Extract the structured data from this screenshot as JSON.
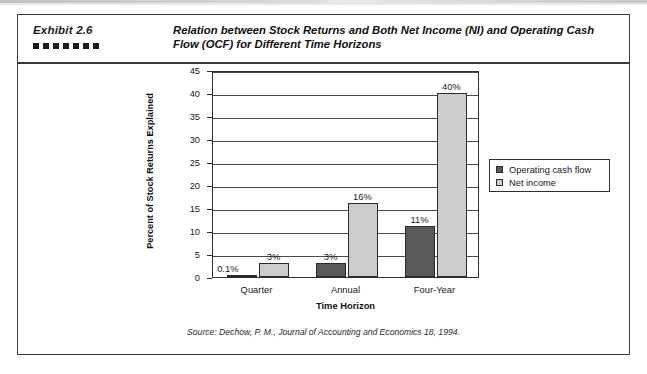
{
  "exhibit": {
    "label": "Exhibit 2.6",
    "dot_count": 7,
    "dot_color": "#1a1a1a"
  },
  "title": "Relation between Stock Returns and Both Net Income (NI) and Operating Cash Flow (OCF) for Different Time Horizons",
  "source": "Source: Dechow, P. M., Journal of Accounting and Economics 18, 1994.",
  "legend": {
    "position": "right",
    "items": [
      {
        "label": "Operating cash flow",
        "color": "#595959"
      },
      {
        "label": "Net income",
        "color": "#cccccc"
      }
    ]
  },
  "chart_data": {
    "type": "bar",
    "title": "Relation between Stock Returns and Both Net Income (NI) and Operating Cash Flow (OCF) for Different Time Horizons",
    "xlabel": "Time Horizon",
    "ylabel": "Percent of Stock Returns Explained",
    "categories": [
      "Quarter",
      "Annual",
      "Four-Year"
    ],
    "series": [
      {
        "name": "Operating cash flow",
        "color": "#595959",
        "values": [
          0.1,
          3,
          11
        ],
        "data_labels": [
          "0.1%",
          "3%",
          "11%"
        ]
      },
      {
        "name": "Net income",
        "color": "#cccccc",
        "values": [
          3,
          16,
          40
        ],
        "data_labels": [
          "3%",
          "16%",
          "40%"
        ]
      }
    ],
    "ylim": [
      0,
      45
    ],
    "yticks": [
      0,
      5,
      10,
      15,
      20,
      25,
      30,
      35,
      40,
      45
    ],
    "ytick_labels": [
      "0",
      "5",
      "10",
      "15",
      "20",
      "25",
      "30",
      "35",
      "40",
      "45"
    ],
    "grid": true,
    "grid_axis": "y",
    "legend_position": "right"
  }
}
